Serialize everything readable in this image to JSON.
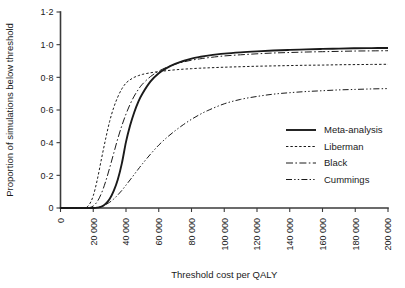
{
  "chart_data": {
    "type": "line",
    "title": "",
    "xlabel": "Threshold cost per QALY",
    "ylabel": "Proportion of simulations below threshold",
    "xlim": [
      0,
      200000
    ],
    "ylim": [
      0,
      1.2
    ],
    "grid": false,
    "legend_position": "center-right",
    "xticks": [
      0,
      20000,
      40000,
      60000,
      80000,
      100000,
      120000,
      140000,
      160000,
      180000,
      200000
    ],
    "xtick_labels": [
      "0",
      "20 000",
      "40 000",
      "60 000",
      "80 000",
      "100 000",
      "120 000",
      "140 000",
      "160 000",
      "180 000",
      "200 000"
    ],
    "xtick_rotation": 90,
    "yticks": [
      0,
      0.2,
      0.4,
      0.6,
      0.8,
      1.0,
      1.2
    ],
    "ytick_labels": [
      "0",
      "0·2",
      "0·4",
      "0·6",
      "0·8",
      "1·0",
      "1·2"
    ],
    "x": [
      0,
      5000,
      10000,
      15000,
      17500,
      20000,
      22500,
      25000,
      27500,
      30000,
      32500,
      35000,
      37500,
      40000,
      42500,
      45000,
      47500,
      50000,
      55000,
      60000,
      65000,
      70000,
      75000,
      80000,
      85000,
      90000,
      100000,
      110000,
      120000,
      130000,
      140000,
      150000,
      160000,
      170000,
      180000,
      190000,
      200000
    ],
    "series": [
      {
        "name": "Meta-analysis",
        "style": "solid",
        "values": [
          0,
          0,
          0,
          0,
          0,
          0,
          0.002,
          0.008,
          0.025,
          0.055,
          0.105,
          0.175,
          0.275,
          0.405,
          0.505,
          0.585,
          0.65,
          0.7,
          0.775,
          0.825,
          0.858,
          0.882,
          0.9,
          0.915,
          0.925,
          0.933,
          0.945,
          0.953,
          0.959,
          0.964,
          0.968,
          0.971,
          0.974,
          0.976,
          0.978,
          0.979,
          0.98
        ]
      },
      {
        "name": "Liberman",
        "style": "dotted",
        "values": [
          0,
          0,
          0,
          0.003,
          0.02,
          0.075,
          0.175,
          0.3,
          0.42,
          0.53,
          0.615,
          0.68,
          0.73,
          0.765,
          0.785,
          0.8,
          0.81,
          0.818,
          0.828,
          0.835,
          0.841,
          0.846,
          0.85,
          0.853,
          0.856,
          0.858,
          0.862,
          0.865,
          0.868,
          0.87,
          0.872,
          0.874,
          0.875,
          0.877,
          0.878,
          0.879,
          0.88
        ]
      },
      {
        "name": "Black",
        "style": "dash-dot",
        "values": [
          0,
          0,
          0,
          0,
          0.002,
          0.012,
          0.04,
          0.09,
          0.16,
          0.245,
          0.335,
          0.425,
          0.505,
          0.575,
          0.635,
          0.685,
          0.725,
          0.758,
          0.805,
          0.838,
          0.862,
          0.88,
          0.894,
          0.905,
          0.913,
          0.92,
          0.931,
          0.938,
          0.944,
          0.949,
          0.952,
          0.955,
          0.957,
          0.959,
          0.961,
          0.962,
          0.963
        ]
      },
      {
        "name": "Cummings",
        "style": "dash-dot-dot",
        "values": [
          0,
          0,
          0,
          0,
          0,
          0.001,
          0.004,
          0.01,
          0.02,
          0.035,
          0.055,
          0.08,
          0.108,
          0.14,
          0.172,
          0.205,
          0.238,
          0.27,
          0.33,
          0.385,
          0.432,
          0.473,
          0.51,
          0.543,
          0.572,
          0.597,
          0.638,
          0.665,
          0.683,
          0.697,
          0.706,
          0.713,
          0.718,
          0.723,
          0.726,
          0.729,
          0.731
        ]
      }
    ]
  },
  "legend": {
    "entries": [
      {
        "label": "Meta-analysis",
        "style": "solid"
      },
      {
        "label": "Liberman",
        "style": "dotted"
      },
      {
        "label": "Black",
        "style": "dash-dot"
      },
      {
        "label": "Cummings",
        "style": "dash-dot-dot"
      }
    ]
  },
  "colors": {
    "line": "#1a1a1a",
    "axis": "#3a3a3a",
    "background": "#ffffff"
  }
}
